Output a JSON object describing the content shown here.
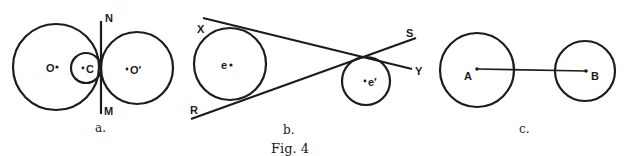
{
  "figure": {
    "caption": "Fig. 4",
    "panels": [
      {
        "id": "a",
        "label": "a.",
        "points": {
          "O": "O",
          "C": "C",
          "O_prime": "O′",
          "N": "N",
          "M": "M"
        },
        "description": "Three circles mutually tangent at one point; common tangent line NM"
      },
      {
        "id": "b",
        "label": "b.",
        "points": {
          "X": "X",
          "Y": "Y",
          "R": "R",
          "S": "S",
          "e": "e",
          "e_prime": "e′"
        },
        "description": "Two circles with crossing common tangents XY and RS"
      },
      {
        "id": "c",
        "label": "c.",
        "points": {
          "A": "A",
          "B": "B"
        },
        "description": "Two separate circles with centers joined by segment AB"
      }
    ]
  }
}
